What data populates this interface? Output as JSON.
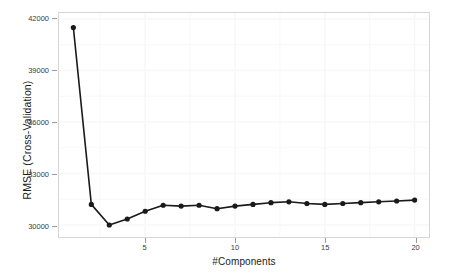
{
  "chart_data": {
    "type": "line",
    "title": "",
    "subtitle": "",
    "xlabel": "#Components",
    "ylabel": "RMSE (Cross-Validation)",
    "x": [
      1,
      2,
      3,
      4,
      5,
      6,
      7,
      8,
      9,
      10,
      11,
      12,
      13,
      14,
      15,
      16,
      17,
      18,
      19,
      20
    ],
    "values": [
      41500,
      31200,
      30000,
      30350,
      30800,
      31150,
      31100,
      31150,
      30950,
      31100,
      31200,
      31300,
      31350,
      31250,
      31200,
      31250,
      31300,
      31350,
      31400,
      31450
    ],
    "series": [
      {
        "name": "RMSE (Cross-Validation)",
        "values": [
          41500,
          31200,
          30000,
          30350,
          30800,
          31150,
          31100,
          31150,
          30950,
          31100,
          31200,
          31300,
          31350,
          31250,
          31200,
          31250,
          31300,
          31350,
          31400,
          31450
        ]
      }
    ],
    "xlim": [
      0.2,
      20.8
    ],
    "ylim": [
      29300,
      42350
    ],
    "xticks": [
      5,
      10,
      15,
      20
    ],
    "xtick_labels": [
      "5",
      "10",
      "15",
      "20"
    ],
    "yticks": [
      30000,
      33000,
      36000,
      39000,
      42000
    ],
    "ytick_labels": [
      "30000",
      "33000",
      "36000",
      "39000",
      "42000"
    ],
    "grid": true,
    "legend": null,
    "legend_position": "none",
    "marker": "filled-circle",
    "line_color": "#1a1a1a",
    "marker_color": "#1a1a1a",
    "panel_background": "#ffffff",
    "grid_color": "#f7f7f7",
    "border_color": "#d6d6d6",
    "annotations": []
  }
}
